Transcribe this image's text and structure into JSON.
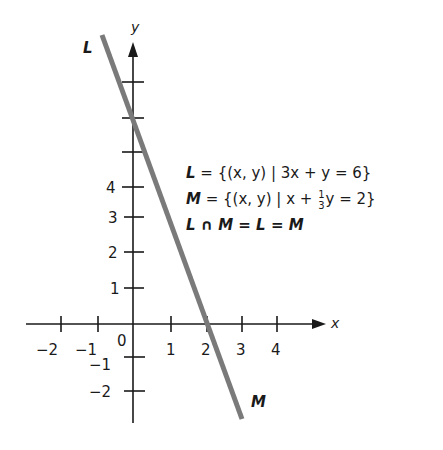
{
  "diagram": {
    "axes": {
      "x_label": "x",
      "y_label": "y",
      "x_ticks": [
        {
          "value": -2,
          "label": "−2",
          "px": 61
        },
        {
          "value": -1,
          "label": "−1",
          "px": 98
        },
        {
          "value": 1,
          "label": "1",
          "px": 171
        },
        {
          "value": 2,
          "label": "2",
          "px": 207
        },
        {
          "value": 3,
          "label": "3",
          "px": 242
        },
        {
          "value": 4,
          "label": "4",
          "px": 277
        }
      ],
      "y_ticks": [
        {
          "value": 1,
          "label": "1",
          "px": 288
        },
        {
          "value": 2,
          "label": "2",
          "px": 252
        },
        {
          "value": 3,
          "label": "3",
          "px": 217
        },
        {
          "value": 4,
          "label": "4",
          "px": 187
        },
        {
          "value": 5,
          "label": "",
          "px": 152
        },
        {
          "value": 6,
          "label": "",
          "px": 118
        },
        {
          "value": 7,
          "label": "",
          "px": 82
        },
        {
          "value": -1,
          "label": "−1",
          "px": 357
        },
        {
          "value": -2,
          "label": "−2",
          "px": 391
        }
      ],
      "origin_label": "0"
    },
    "line": {
      "top_label": "L",
      "bottom_label": "M",
      "color": "#7a7a7a"
    },
    "equations": {
      "L_name": "L",
      "L_rhs": "= {(x, y) | 3x + y = 6}",
      "M_name": "M",
      "M_rhs_a": "= {(x, y) | x +",
      "M_frac_num": "1",
      "M_frac_den": "3",
      "M_rhs_b": "y = 2}",
      "intersection": "L ∩ M = L = M"
    }
  }
}
